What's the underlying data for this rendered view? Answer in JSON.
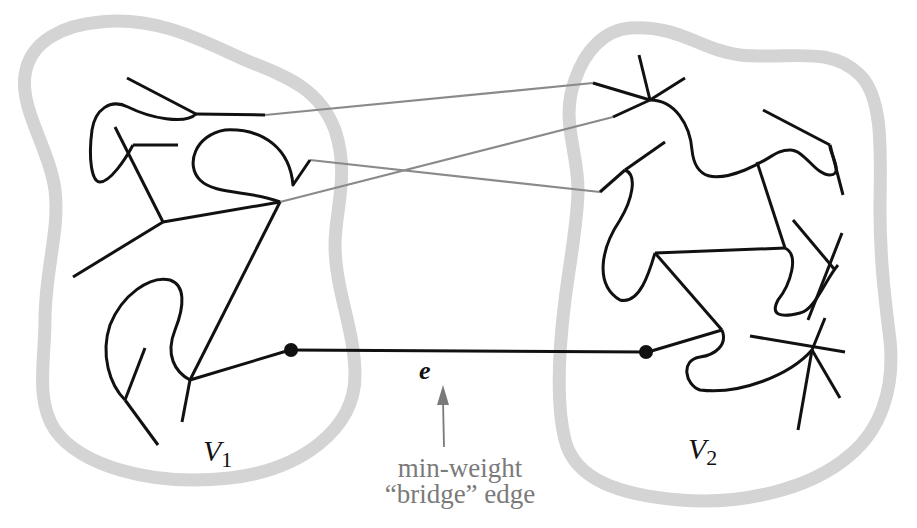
{
  "figure": {
    "title_fragment": "",
    "partition_labels": [
      {
        "name": "V",
        "subscript": "1"
      },
      {
        "name": "V",
        "subscript": "2"
      }
    ],
    "bridge_edge_label": "e",
    "annotation": {
      "line1": "min-weight",
      "line2": "“bridge” edge"
    },
    "colors": {
      "blob_border": "#d4d4d4",
      "tree_edges": "#111111",
      "crossing_edges": "#8a8a8a",
      "annotation": "#7a7a7a"
    },
    "elements": {
      "partitions": [
        "V1",
        "V2"
      ],
      "bridge_edge": "e",
      "crossing_edges_count": 3
    }
  }
}
